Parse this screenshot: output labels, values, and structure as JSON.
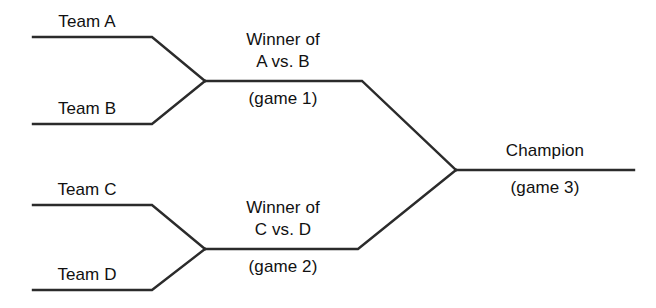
{
  "diagram": {
    "line_color": "#2b2b2b",
    "background_color": "#ffffff"
  },
  "round1": {
    "matches": [
      {
        "top_team": "Team A",
        "bottom_team": "Team B",
        "winner_line1": "Winner of",
        "winner_line2": "A vs. B",
        "game": "(game 1)"
      },
      {
        "top_team": "Team C",
        "bottom_team": "Team D",
        "winner_line1": "Winner of",
        "winner_line2": "C vs. D",
        "game": "(game 2)"
      }
    ]
  },
  "final": {
    "winner": "Champion",
    "game": "(game 3)"
  }
}
